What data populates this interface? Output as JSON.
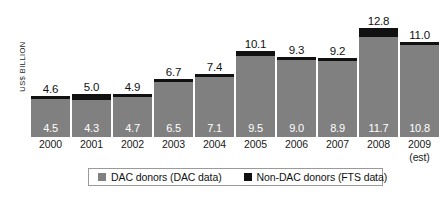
{
  "chart_data": {
    "type": "bar",
    "stacked": true,
    "title": "",
    "subtitle": "",
    "xlabel": "",
    "ylabel": "US$ BILLION",
    "ylim": [
      0,
      13.5
    ],
    "grid": false,
    "legend_position": "bottom",
    "categories": [
      "2000",
      "2001",
      "2002",
      "2003",
      "2004",
      "2005",
      "2006",
      "2007",
      "2008",
      "2009"
    ],
    "category_sublabels": [
      "",
      "",
      "",
      "",
      "",
      "",
      "",
      "",
      "",
      "(est)"
    ],
    "series": [
      {
        "name": "DAC donors (DAC data)",
        "color": "#808080",
        "values": [
          4.5,
          4.3,
          4.7,
          6.5,
          7.1,
          9.5,
          9.0,
          8.9,
          11.7,
          10.8
        ]
      },
      {
        "name": "Non-DAC donors (FTS data)",
        "color": "#111111",
        "values": [
          0.1,
          0.7,
          0.2,
          0.2,
          0.3,
          0.6,
          0.3,
          0.3,
          1.1,
          0.2
        ]
      }
    ],
    "totals": [
      4.6,
      5.0,
      4.9,
      6.7,
      7.4,
      10.1,
      9.3,
      9.2,
      12.8,
      11.0
    ],
    "total_labels": [
      "4.6",
      "5.0",
      "4.9",
      "6.7",
      "7.4",
      "10.1",
      "9.3",
      "9.2",
      "12.8",
      "11.0"
    ],
    "dac_labels": [
      "4.5",
      "4.3",
      "4.7",
      "6.5",
      "7.1",
      "9.5",
      "9.0",
      "8.9",
      "11.7",
      "10.8"
    ],
    "nondac_labels": [
      "0.1",
      "0.7",
      "0.2",
      "0.2",
      "0.3",
      "0.6",
      "0.3",
      "0.3",
      "1.1",
      "0.2"
    ]
  },
  "legend": {
    "items": [
      {
        "label": "DAC donors (DAC data)",
        "swatch": "gray-square-icon"
      },
      {
        "label": "Non-DAC donors (FTS data)",
        "swatch": "black-square-icon"
      }
    ]
  },
  "axis": {
    "y_title": "US$ BILLION"
  },
  "colors": {
    "dac": "#808080",
    "nondac": "#111111",
    "background": "#ffffff",
    "text": "#111111",
    "legend_border": "#9a9a9a"
  }
}
